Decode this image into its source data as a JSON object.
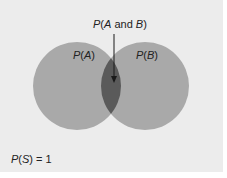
{
  "diagram": {
    "type": "venn",
    "colors": {
      "background": "#ececec",
      "circle": "#a9a9a9",
      "intersection": "#5a5a5a",
      "arrow": "#1a1a1a",
      "text": "#222222"
    },
    "labels": {
      "intersection": {
        "p": "P",
        "open": "(",
        "a": "A",
        "and": " and ",
        "b": "B",
        "close": ")"
      },
      "set_a": {
        "p": "P",
        "open": "(",
        "v": "A",
        "close": ")"
      },
      "set_b": {
        "p": "P",
        "open": "(",
        "v": "B",
        "close": ")"
      },
      "sample_space": {
        "p": "P",
        "open": "(",
        "v": "S",
        "close": ")",
        "eq": " = 1"
      }
    }
  }
}
